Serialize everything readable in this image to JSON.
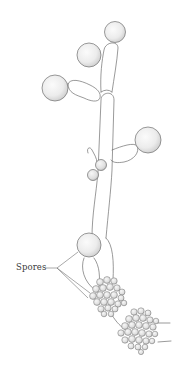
{
  "figure": {
    "labels": [
      {
        "id": "spores",
        "text": "Spores"
      }
    ],
    "colors": {
      "background": "#ffffff",
      "stroke": "#6e6e6e",
      "fill_light": "#f2f2f2",
      "fill_shade": "#d9d9d9",
      "label_text": "#3a3a3a"
    }
  }
}
